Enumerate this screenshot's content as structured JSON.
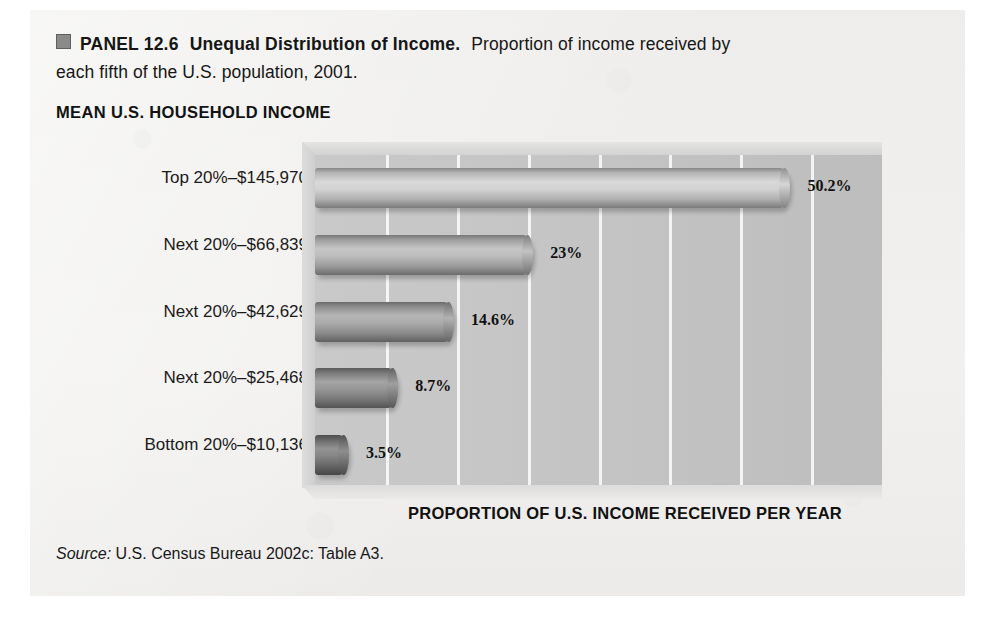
{
  "caption": {
    "marker": "panel-marker-square",
    "panel_label": "PANEL 12.6",
    "title": "Unequal Distribution of Income.",
    "description": "Proportion of income received by each fifth of the U.S. population, 2001."
  },
  "chart_heading": "MEAN U.S. HOUSEHOLD INCOME",
  "axis_title": "PROPORTION OF U.S. INCOME RECEIVED PER YEAR",
  "source": {
    "label": "Source:",
    "text": "U.S. Census Bureau 2002c: Table A3."
  },
  "colors": {
    "panel_background": "#eeeeed",
    "plot_background": "#c4c4c4",
    "gridline": "#ffffff",
    "bar_lightest": "#cfcfcf",
    "bar_darkest": "#6f6f6f",
    "text": "#161616"
  },
  "chart_data": {
    "type": "bar",
    "orientation": "horizontal",
    "title": "MEAN U.S. HOUSEHOLD INCOME",
    "xlabel": "PROPORTION OF U.S. INCOME RECEIVED PER YEAR",
    "ylabel": "",
    "xlim": [
      0,
      60
    ],
    "grid": true,
    "gridline_count": 8,
    "legend": "none",
    "categories": [
      "Top 20%–$145,970",
      "Next 20%–$66,839",
      "Next 20%–$42,629",
      "Next 20%–$25,468",
      "Bottom 20%–$10,136"
    ],
    "values": [
      50.2,
      23,
      14.6,
      8.7,
      3.5
    ],
    "value_labels": [
      "50.2%",
      "23%",
      "14.6%",
      "8.7%",
      "3.5%"
    ],
    "mean_incomes": [
      145970,
      66839,
      42629,
      25468,
      10136
    ],
    "bar_colors": [
      "#cdcdcd",
      "#b4b4b4",
      "#a0a0a0",
      "#8a8a8a",
      "#757575"
    ],
    "units": "percent"
  }
}
